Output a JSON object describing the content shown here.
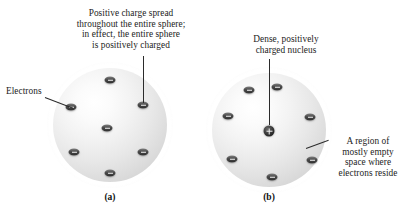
{
  "figure": {
    "background_color": "#ffffff",
    "sphere_color": "#e3e3e3",
    "glyph_color": "#2e2e2e",
    "text_color": "#1c1c1c"
  },
  "annotations": {
    "positive_charge_spread": "Positive charge spread\nthroughout the entire sphere;\nin effect, the entire sphere\nis positively charged",
    "electrons": "Electrons",
    "dense_nucleus": "Dense, positively\ncharged nucleus",
    "empty_space": "A region of\nmostly empty\nspace where\nelectrons reside"
  },
  "captions": {
    "panel_a": "(a)",
    "panel_b": "(b)"
  },
  "panel_a": {
    "name": "plum-pudding-model",
    "sphere": {
      "cx": 110,
      "cy": 125,
      "r": 57
    },
    "electrons": [
      {
        "cx": 110,
        "cy": 80
      },
      {
        "cx": 143,
        "cy": 105
      },
      {
        "cx": 143,
        "cy": 152
      },
      {
        "cx": 110,
        "cy": 173
      },
      {
        "cx": 74,
        "cy": 152
      },
      {
        "cx": 71,
        "cy": 107
      },
      {
        "cx": 107,
        "cy": 128
      }
    ]
  },
  "panel_b": {
    "name": "nuclear-model",
    "sphere": {
      "cx": 269,
      "cy": 130,
      "r": 57
    },
    "nucleus": {
      "cx": 269,
      "cy": 131
    },
    "electrons": [
      {
        "cx": 277,
        "cy": 87
      },
      {
        "cx": 310,
        "cy": 117
      },
      {
        "cx": 312,
        "cy": 160
      },
      {
        "cx": 272,
        "cy": 177
      },
      {
        "cx": 232,
        "cy": 159
      },
      {
        "cx": 228,
        "cy": 116
      },
      {
        "cx": 249,
        "cy": 90
      }
    ]
  }
}
